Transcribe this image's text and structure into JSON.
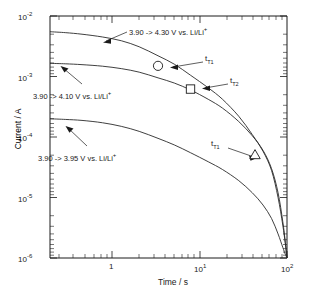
{
  "chart_data": {
    "type": "line",
    "title": "",
    "xlabel": "Time / s",
    "ylabel": "Current / A",
    "xscale": "log",
    "yscale": "log",
    "xlim": [
      0.27,
      100
    ],
    "ylim": [
      1e-06,
      0.01
    ],
    "grid": false,
    "legend_position": "none",
    "xticks": [
      "1",
      "10",
      "100"
    ],
    "xtick_labels": [
      "1",
      "10¹",
      "10²"
    ],
    "yticks": [
      1e-06,
      1e-05,
      0.0001,
      0.001,
      0.01
    ],
    "ytick_labels": [
      "10⁻⁶",
      "10⁻⁵",
      "10⁻⁴",
      "10⁻³",
      "10⁻²"
    ],
    "series": [
      {
        "name": "3.90 -> 4.30 V vs. Li/Li+",
        "x": [
          0.27,
          0.4,
          0.6,
          1.0,
          1.6,
          2.5,
          4.0,
          6.0,
          9.0,
          14.0,
          20.0,
          30.0,
          42.0,
          55.0,
          68.0,
          80.0,
          90.0,
          96.0,
          100.0
        ],
        "y": [
          0.0055,
          0.0053,
          0.005,
          0.0045,
          0.0039,
          0.0031,
          0.0022,
          0.0016,
          0.00105,
          0.00065,
          0.00042,
          0.00022,
          0.00011,
          5.8e-05,
          2.8e-05,
          1e-05,
          3.5e-06,
          1.7e-06,
          1e-06
        ]
      },
      {
        "name": "3.90 -> 4.10 V vs. Li/Li+",
        "x": [
          0.27,
          0.4,
          0.6,
          1.0,
          1.6,
          2.5,
          4.0,
          6.0,
          9.0,
          14.0,
          20.0,
          30.0,
          42.0,
          55.0,
          68.0,
          80.0,
          90.0,
          96.0,
          100.0
        ],
        "y": [
          0.00165,
          0.00162,
          0.00157,
          0.00148,
          0.00135,
          0.00118,
          0.00095,
          0.00078,
          0.0006,
          0.00042,
          0.0003,
          0.00018,
          0.000105,
          6e-05,
          3e-05,
          1.2e-05,
          4e-06,
          1.8e-06,
          1e-06
        ]
      },
      {
        "name": "3.90 -> 3.95 V vs. Li/Li+",
        "x": [
          0.27,
          0.4,
          0.6,
          1.0,
          1.6,
          2.5,
          4.0,
          6.0,
          9.0,
          14.0,
          20.0,
          30.0,
          42.0,
          55.0,
          68.0,
          80.0,
          90.0,
          96.0,
          100.0
        ],
        "y": [
          0.0002,
          0.000195,
          0.000188,
          0.000172,
          0.00015,
          0.000124,
          9.5e-05,
          7.4e-05,
          5.5e-05,
          3.9e-05,
          2.9e-05,
          1.9e-05,
          1.2e-05,
          7.5e-06,
          4.5e-06,
          2.5e-06,
          1.5e-06,
          1.15e-06,
          1e-06
        ]
      }
    ],
    "markers": [
      {
        "shape": "circle",
        "x": 4.0,
        "y": 0.0015,
        "label": "t",
        "label_sub": "T1"
      },
      {
        "shape": "square",
        "x": 9.0,
        "y": 0.00062,
        "label": "t",
        "label_sub": "T2"
      },
      {
        "shape": "triangle",
        "x": 45.0,
        "y": 5e-05,
        "label": "t",
        "label_sub": "T1"
      }
    ],
    "annotations": [
      {
        "text": "3.90 -> 4.30 V vs. Li/Li",
        "sup": "+"
      },
      {
        "text": "3.90 -> 4.10 V vs. Li/Li",
        "sup": "+"
      },
      {
        "text": "3.90 -> 3.95 V vs. Li/Li",
        "sup": "+"
      }
    ]
  },
  "axes": {
    "x_title": "Time / s",
    "y_title": "Current / A",
    "x_tick_1": "1",
    "x_tick_2_base": "10",
    "x_tick_2_exp": "1",
    "x_tick_3_base": "10",
    "x_tick_3_exp": "2",
    "y_tick_1_base": "10",
    "y_tick_1_exp": "-2",
    "y_tick_2_base": "10",
    "y_tick_2_exp": "-3",
    "y_tick_3_base": "10",
    "y_tick_3_exp": "-4",
    "y_tick_4_base": "10",
    "y_tick_4_exp": "-5",
    "y_tick_5_base": "10",
    "y_tick_5_exp": "-6"
  },
  "annotations": {
    "curve_430": "3.90 -> 4.30 V vs. Li/Li",
    "curve_430_sup": "+",
    "curve_410": "3.90 -> 4.10 V vs. Li/Li",
    "curve_410_sup": "+",
    "curve_395": "3.90 -> 3.95 V vs. Li/Li",
    "curve_395_sup": "+",
    "marker_circle_label": "t",
    "marker_circle_sub": "T1",
    "marker_square_label": "t",
    "marker_square_sub": "T2",
    "marker_triangle_label": "t",
    "marker_triangle_sub": "T1"
  },
  "colors": {
    "axis": "#1a1a1a",
    "curve": "#2a2a2a",
    "background": "#ffffff"
  }
}
